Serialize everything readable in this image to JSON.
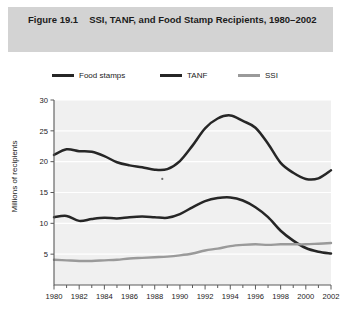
{
  "figure": {
    "number": "Figure 19.1",
    "title": "SSI, TANF, and Food Stamp Recipients, 1980–2002"
  },
  "legend": {
    "position": "top",
    "items": [
      {
        "label": "Food stamps",
        "color": "#262626"
      },
      {
        "label": "TANF",
        "color": "#262626"
      },
      {
        "label": "SSI",
        "color": "#9a9a9a"
      }
    ]
  },
  "axes": {
    "y_title": "Millions of recipients",
    "y_ticks": [
      "5",
      "10",
      "15",
      "20",
      "25",
      "30"
    ],
    "x_ticks": [
      "1980",
      "1982",
      "1984",
      "1986",
      "1988",
      "1990",
      "1992",
      "1994",
      "1996",
      "1998",
      "2000",
      "2002"
    ]
  },
  "colors": {
    "title_band": "#d3d3d3",
    "plot_background": "#f0f0f0",
    "gridline": "#ffffff",
    "axis": "#5a5a5a",
    "dark_series": "#262626",
    "light_series": "#9a9a9a",
    "text": "#1b1b1b"
  },
  "chart_data": {
    "type": "line",
    "title": "SSI, TANF, and Food Stamp Recipients, 1980–2002",
    "xlabel": "",
    "ylabel": "Millions of recipients",
    "xlim": [
      1980,
      2002
    ],
    "ylim": [
      0,
      30
    ],
    "yticks": [
      5,
      10,
      15,
      20,
      25,
      30
    ],
    "xticks": [
      1980,
      1982,
      1984,
      1986,
      1988,
      1990,
      1992,
      1994,
      1996,
      1998,
      2000,
      2002
    ],
    "grid": true,
    "legend_position": "above-plot",
    "x": [
      1980,
      1981,
      1982,
      1983,
      1984,
      1985,
      1986,
      1987,
      1988,
      1989,
      1990,
      1991,
      1992,
      1993,
      1994,
      1995,
      1996,
      1997,
      1998,
      1999,
      2000,
      2001,
      2002
    ],
    "series": [
      {
        "name": "Food stamps",
        "color": "#262626",
        "values": [
          21.1,
          22.0,
          21.7,
          21.6,
          20.9,
          19.9,
          19.4,
          19.1,
          18.7,
          18.8,
          20.1,
          22.6,
          25.4,
          27.0,
          27.5,
          26.6,
          25.5,
          22.9,
          19.8,
          18.2,
          17.2,
          17.3,
          18.6
        ]
      },
      {
        "name": "TANF",
        "color": "#262626",
        "values": [
          11.0,
          11.2,
          10.4,
          10.7,
          10.9,
          10.8,
          11.0,
          11.1,
          11.0,
          10.9,
          11.5,
          12.6,
          13.6,
          14.1,
          14.2,
          13.7,
          12.6,
          11.0,
          8.8,
          7.2,
          6.0,
          5.4,
          5.1
        ]
      },
      {
        "name": "SSI",
        "color": "#9a9a9a",
        "values": [
          4.1,
          4.0,
          3.9,
          3.9,
          4.0,
          4.1,
          4.3,
          4.4,
          4.5,
          4.6,
          4.8,
          5.1,
          5.6,
          5.9,
          6.3,
          6.5,
          6.6,
          6.5,
          6.6,
          6.6,
          6.6,
          6.7,
          6.8
        ]
      }
    ]
  }
}
